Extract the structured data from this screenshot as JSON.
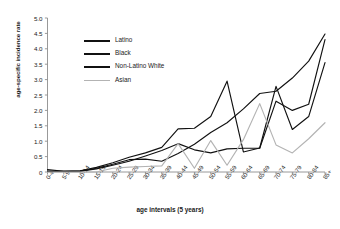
{
  "chart_data": {
    "type": "line",
    "title": "",
    "xlabel": "age intervals (5 years)",
    "ylabel": "age-specific incidence rate",
    "categories": [
      "0-4",
      "5-9",
      "10-14",
      "15-19",
      "20-24",
      "25-29",
      "30-34",
      "35-39",
      "40-44",
      "45-49",
      "50-54",
      "55-59",
      "60-64",
      "65-69",
      "70-74",
      "75-79",
      "80-84",
      "85+"
    ],
    "ylim": [
      0,
      5.0
    ],
    "yticks": [
      "0",
      "0.5",
      "1.0",
      "1.5",
      "2.0",
      "2.5",
      "3.0",
      "3.5",
      "4.0",
      "4.5",
      "5.0"
    ],
    "ytick_values": [
      0,
      0.5,
      1.0,
      1.5,
      2.0,
      2.5,
      3.0,
      3.5,
      4.0,
      4.5,
      5.0
    ],
    "grid": false,
    "legend_position": "upper-left-inside",
    "series": [
      {
        "name": "Latino",
        "color": "#111111",
        "values": [
          0.08,
          0.02,
          0.03,
          0.1,
          0.22,
          0.35,
          0.52,
          0.7,
          0.92,
          0.72,
          0.62,
          0.75,
          0.77,
          0.77,
          2.3,
          2.0,
          2.2,
          4.3
        ]
      },
      {
        "name": "Black",
        "color": "#111111",
        "values": [
          0.02,
          0.02,
          0.04,
          0.15,
          0.3,
          0.48,
          0.62,
          0.8,
          1.4,
          1.42,
          1.8,
          2.95,
          0.65,
          0.78,
          2.78,
          1.38,
          1.8,
          3.55
        ]
      },
      {
        "name": "Non-Latino White",
        "color": "#111111",
        "values": [
          0.03,
          0.02,
          0.03,
          0.12,
          0.25,
          0.4,
          0.42,
          0.35,
          0.6,
          0.9,
          1.28,
          1.6,
          2.05,
          2.55,
          2.62,
          3.05,
          3.6,
          4.48
        ]
      },
      {
        "name": "Asian",
        "color": "#b3b3b3",
        "values": [
          0.0,
          0.0,
          0.0,
          0.0,
          0.12,
          0.16,
          0.18,
          0.2,
          0.92,
          0.12,
          1.02,
          0.22,
          1.05,
          2.22,
          0.88,
          0.62,
          1.08,
          1.6
        ]
      }
    ]
  },
  "axes": {
    "ylabel": "age-specific incidence rate",
    "xlabel": "age intervals (5 years)"
  },
  "legend": {
    "items": [
      {
        "label": "Latino"
      },
      {
        "label": "Black"
      },
      {
        "label": "Non-Latino White"
      },
      {
        "label": "Asian"
      }
    ]
  }
}
